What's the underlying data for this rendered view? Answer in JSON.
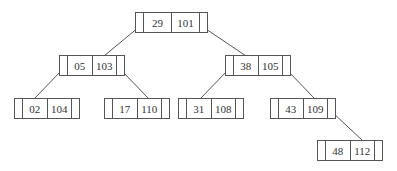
{
  "diagram": {
    "type": "binary-search-tree",
    "line_color": "#555555",
    "nodes": [
      {
        "id": "root",
        "key": "29",
        "value": "101",
        "x": 135,
        "y": 12,
        "w": 73
      },
      {
        "id": "n05",
        "key": "05",
        "value": "103",
        "x": 59,
        "y": 55,
        "w": 66
      },
      {
        "id": "n38",
        "key": "38",
        "value": "105",
        "x": 225,
        "y": 55,
        "w": 66
      },
      {
        "id": "n02",
        "key": "02",
        "value": "104",
        "x": 14,
        "y": 98,
        "w": 66
      },
      {
        "id": "n17",
        "key": "17",
        "value": "110",
        "x": 104,
        "y": 98,
        "w": 66
      },
      {
        "id": "n31",
        "key": "31",
        "value": "108",
        "x": 178,
        "y": 98,
        "w": 66
      },
      {
        "id": "n43",
        "key": "43",
        "value": "109",
        "x": 270,
        "y": 98,
        "w": 66
      },
      {
        "id": "n48",
        "key": "48",
        "value": "112",
        "x": 317,
        "y": 140,
        "w": 66
      }
    ],
    "edges": [
      {
        "from": "root",
        "to": "n05",
        "side": "left",
        "x1": 139,
        "y1": 27,
        "x2": 104,
        "y2": 56
      },
      {
        "from": "root",
        "to": "n38",
        "side": "right",
        "x1": 203,
        "y1": 27,
        "x2": 246,
        "y2": 56
      },
      {
        "from": "n05",
        "to": "n02",
        "side": "left",
        "x1": 62,
        "y1": 70,
        "x2": 34,
        "y2": 99
      },
      {
        "from": "n05",
        "to": "n17",
        "side": "right",
        "x1": 121,
        "y1": 70,
        "x2": 149,
        "y2": 99
      },
      {
        "from": "n38",
        "to": "n31",
        "side": "left",
        "x1": 228,
        "y1": 70,
        "x2": 200,
        "y2": 99
      },
      {
        "from": "n38",
        "to": "n43",
        "side": "right",
        "x1": 287,
        "y1": 70,
        "x2": 315,
        "y2": 99
      },
      {
        "from": "n43",
        "to": "n48",
        "side": "right",
        "x1": 332,
        "y1": 112,
        "x2": 363,
        "y2": 141
      }
    ]
  }
}
